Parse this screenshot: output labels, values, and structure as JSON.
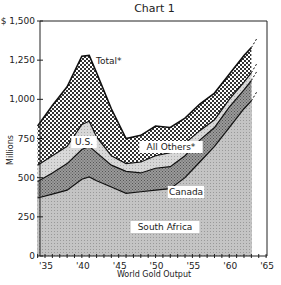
{
  "chart_data": {
    "type": "area",
    "stacked": true,
    "title": "Chart 1",
    "xlabel": "World Gold Output",
    "ylabel": "Millions",
    "y_unit_prefix": "$",
    "ylim": [
      0,
      1500
    ],
    "xlim": [
      1934,
      1965
    ],
    "yticks": [
      0,
      250,
      500,
      750,
      1000,
      1250,
      1500
    ],
    "ytick_labels": [
      "0",
      "250",
      "500",
      "750",
      "1,000",
      "1,250",
      "$ 1,500"
    ],
    "xticks": [
      1935,
      1940,
      1945,
      1950,
      1955,
      1960,
      1965
    ],
    "xtick_labels": [
      "'35",
      "'40",
      "'45",
      "'50",
      "'55",
      "'60",
      "'65"
    ],
    "grid": false,
    "legend": "inline labels",
    "x": [
      1934,
      1936,
      1938,
      1940,
      1941,
      1942,
      1944,
      1946,
      1948,
      1950,
      1952,
      1954,
      1956,
      1958,
      1960,
      1962,
      1963
    ],
    "series": [
      {
        "name": "South Africa",
        "values": [
          370,
          395,
          420,
          490,
          505,
          480,
          440,
          400,
          410,
          420,
          430,
          500,
          600,
          700,
          820,
          940,
          990
        ]
      },
      {
        "name": "Canada",
        "values": [
          105,
          135,
          170,
          190,
          195,
          180,
          140,
          140,
          120,
          140,
          140,
          140,
          140,
          120,
          130,
          120,
          130
        ]
      },
      {
        "name": "U.S.",
        "values": [
          105,
          110,
          110,
          160,
          160,
          100,
          60,
          50,
          70,
          80,
          90,
          80,
          60,
          50,
          50,
          50,
          50
        ]
      },
      {
        "name": "All Others*",
        "values": [
          250,
          320,
          380,
          435,
          420,
          410,
          300,
          160,
          170,
          190,
          160,
          160,
          170,
          170,
          160,
          170,
          160
        ]
      }
    ],
    "cumulative_total": [
      830,
      960,
      1080,
      1275,
      1280,
      1170,
      940,
      750,
      770,
      830,
      820,
      880,
      970,
      1040,
      1160,
      1280,
      1330
    ],
    "annotations": [
      "Total*",
      "U.S.",
      "All Others*",
      "Canada",
      "South Africa"
    ]
  },
  "labels": {
    "title": "Chart 1",
    "xlabel": "World Gold Output",
    "ylabel": "Millions",
    "total": "Total",
    "us": "U.S.",
    "others": "All Others",
    "canada": "Canada",
    "south_africa": "South Africa",
    "star": "*"
  }
}
